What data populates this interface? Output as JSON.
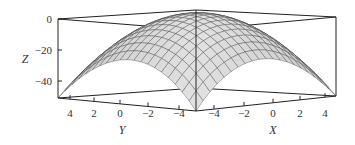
{
  "chart_data": {
    "type": "surface3d",
    "function": "z = -(x^2 + y^2)",
    "title": "",
    "xlabel": "X",
    "ylabel": "Y",
    "zlabel": "Z",
    "x_range": [
      -5,
      5
    ],
    "y_range": [
      -5,
      5
    ],
    "z_range": [
      -50,
      0
    ],
    "x_ticks": [
      "-4",
      "-2",
      "0",
      "2",
      "4"
    ],
    "y_ticks": [
      "4",
      "2",
      "0",
      "-2",
      "-4"
    ],
    "z_ticks": [
      "0",
      "-20",
      "-40"
    ],
    "grid_lines": 21,
    "surface_color": "#d9d9d9",
    "mesh_color": "#333333",
    "box": true,
    "peak": {
      "x": 0,
      "y": 0,
      "z": 0
    },
    "corner_values": [
      {
        "x": -5,
        "y": -5,
        "z": -50
      },
      {
        "x": 5,
        "y": -5,
        "z": -50
      },
      {
        "x": -5,
        "y": 5,
        "z": -50
      },
      {
        "x": 5,
        "y": 5,
        "z": -50
      }
    ]
  },
  "axes": {
    "z_label": "Z",
    "y_label": "Y",
    "x_label": "X",
    "z_ticks": [
      {
        "label": "0",
        "y": 21
      },
      {
        "label": "−20",
        "y": 52
      },
      {
        "label": "−40",
        "y": 83
      }
    ],
    "y_ticks": [
      {
        "label": "4",
        "x": 70
      },
      {
        "label": "2",
        "x": 94
      },
      {
        "label": "0",
        "x": 120
      },
      {
        "label": "−2",
        "x": 148
      },
      {
        "label": "−4",
        "x": 179
      }
    ],
    "x_ticks": [
      {
        "label": "−4",
        "x": 214
      },
      {
        "label": "−2",
        "x": 244
      },
      {
        "label": "0",
        "x": 273
      },
      {
        "label": "2",
        "x": 300
      },
      {
        "label": "4",
        "x": 325
      }
    ]
  }
}
